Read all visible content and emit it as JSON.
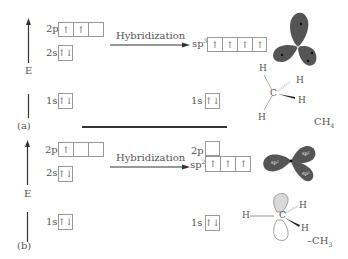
{
  "panel_a": {
    "label": "(a)",
    "energy_axis_label": "E",
    "ground_state": {
      "orbitals": [
        {
          "name": "2p",
          "cells": [
            "↑",
            "↑",
            ""
          ]
        },
        {
          "name": "2s",
          "cells": [
            "↑↓"
          ]
        },
        {
          "name": "1s",
          "cells": [
            "↑↓"
          ]
        }
      ]
    },
    "arrow_label": "Hybridization",
    "hybrid_state": {
      "orbitals": [
        {
          "name": "sp",
          "sup": "3",
          "cells": [
            "↑",
            "↑",
            "↑",
            "↑"
          ]
        },
        {
          "name": "1s",
          "cells": [
            "↑↓"
          ]
        }
      ]
    },
    "orbital_shape": "tetrahedral sp3 lobes",
    "molecule": {
      "center": "C",
      "atoms": [
        "H",
        "H",
        "H",
        "H"
      ],
      "formula": "CH",
      "formula_sub": "4"
    }
  },
  "panel_b": {
    "label": "(b)",
    "energy_axis_label": "E",
    "ground_state": {
      "orbitals": [
        {
          "name": "2p",
          "cells": [
            "↑",
            "",
            ""
          ]
        },
        {
          "name": "2s",
          "cells": [
            "↑↓"
          ]
        },
        {
          "name": "1s",
          "cells": [
            "↑↓"
          ]
        }
      ]
    },
    "arrow_label": "Hybridization",
    "hybrid_state": {
      "orbitals": [
        {
          "name": "2p",
          "cells": [
            ""
          ]
        },
        {
          "name": "sp",
          "sup": "2",
          "cells": [
            "↑",
            "↑",
            "↑"
          ]
        },
        {
          "name": "1s",
          "cells": [
            "↑↓"
          ]
        }
      ]
    },
    "orbital_shape": "trigonal planar sp2 lobes",
    "lobe_labels": [
      "sp²",
      "sp²",
      "sp²"
    ],
    "molecule": {
      "center": "C",
      "atoms": [
        "H",
        "H",
        "H"
      ],
      "formula": "–CH",
      "formula_sub": "3"
    }
  },
  "colors": {
    "lobe_fill": "#555555",
    "p_orbital_fill": "#d9d9d9",
    "line": "#333333",
    "box_border": "#999999"
  }
}
